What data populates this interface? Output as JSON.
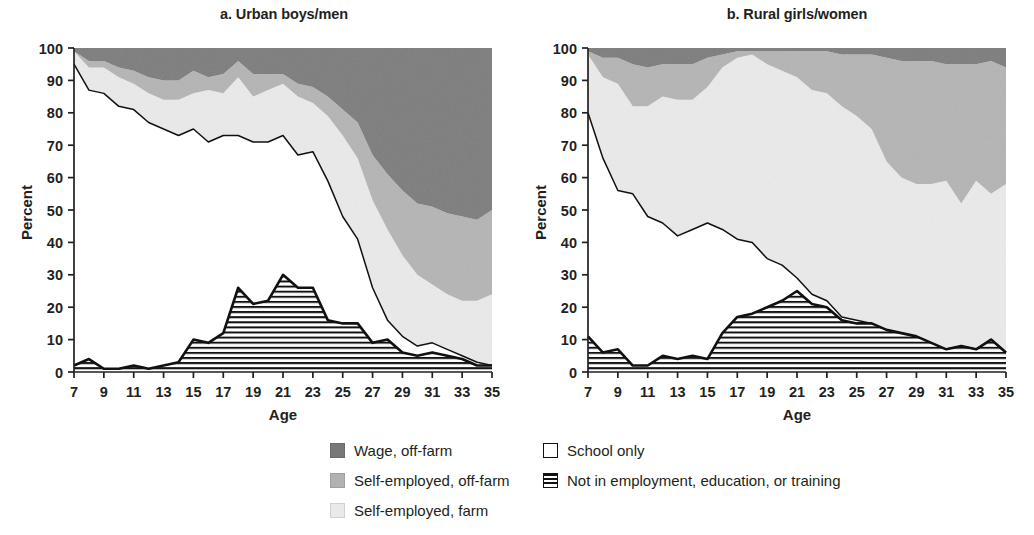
{
  "figure": {
    "panels": [
      {
        "id": "a",
        "title": "a. Urban boys/men",
        "xlabel": "Age",
        "ylabel": "Percent"
      },
      {
        "id": "b",
        "title": "b. Rural girls/women",
        "xlabel": "Age",
        "ylabel": "Percent"
      }
    ]
  },
  "legend": {
    "column1": [
      {
        "label": "Wage, off-farm",
        "swatch": "solid",
        "color": "#787878",
        "name": "legend-swatch-wage-off-farm"
      },
      {
        "label": "Self-employed, off-farm",
        "swatch": "solid",
        "color": "#b2b2b2",
        "name": "legend-swatch-self-employed-off-farm"
      },
      {
        "label": "Self-employed, farm",
        "swatch": "solid",
        "color": "#e9e9e9",
        "name": "legend-swatch-self-employed-farm"
      }
    ],
    "column2": [
      {
        "label": "School only",
        "swatch": "solid",
        "color": "#ffffff",
        "name": "legend-swatch-school-only"
      },
      {
        "label": "Not in employment, education, or training",
        "swatch": "hatch",
        "color": "#ffffff",
        "name": "legend-swatch-neet"
      }
    ]
  },
  "chart_data": {
    "type": "area",
    "stacked": true,
    "xlabel": "Age",
    "ylabel": "Percent",
    "xlim": [
      7,
      35
    ],
    "ylim": [
      0,
      100
    ],
    "yticks": [
      0,
      10,
      20,
      30,
      40,
      50,
      60,
      70,
      80,
      90,
      100
    ],
    "xticks": [
      7,
      9,
      11,
      13,
      15,
      17,
      19,
      21,
      23,
      25,
      27,
      29,
      31,
      33,
      35
    ],
    "grid": false,
    "legend_position": "bottom-center",
    "colors": {
      "wage_off_farm": "#787878",
      "self_employed_off_farm": "#b2b2b2",
      "self_employed_farm": "#e9e9e9",
      "school_only": "#ffffff",
      "neet": "#ffffff-hatched"
    },
    "stack_order_bottom_to_top": [
      "Not in employment, education, or training",
      "School only",
      "Self-employed, farm",
      "Self-employed, off-farm",
      "Wage, off-farm"
    ],
    "panels": [
      {
        "id": "a",
        "title": "a. Urban boys/men",
        "x": [
          7,
          8,
          9,
          10,
          11,
          12,
          13,
          14,
          15,
          16,
          17,
          18,
          19,
          20,
          21,
          22,
          23,
          24,
          25,
          26,
          27,
          28,
          29,
          30,
          31,
          32,
          33,
          34,
          35
        ],
        "series": [
          {
            "name": "Not in employment, education, or training",
            "values": [
              2,
              4,
              1,
              1,
              2,
              1,
              2,
              3,
              10,
              9,
              12,
              26,
              21,
              22,
              30,
              26,
              26,
              16,
              15,
              15,
              9,
              10,
              6,
              5,
              6,
              5,
              4,
              2,
              2
            ]
          },
          {
            "name": "School only",
            "values": [
              93,
              83,
              85,
              81,
              79,
              76,
              73,
              70,
              65,
              62,
              61,
              47,
              50,
              49,
              43,
              41,
              42,
              43,
              33,
              26,
              17,
              6,
              5,
              3,
              3,
              2,
              1,
              1,
              0
            ]
          },
          {
            "name": "Self-employed, farm",
            "values": [
              4,
              7,
              8,
              9,
              8,
              9,
              9,
              11,
              11,
              16,
              13,
              18,
              14,
              16,
              16,
              18,
              15,
              20,
              25,
              25,
              27,
              28,
              25,
              22,
              18,
              17,
              17,
              19,
              22
            ]
          },
          {
            "name": "Self-employed, off-farm",
            "values": [
              0,
              2,
              2,
              3,
              4,
              5,
              6,
              6,
              7,
              4,
              6,
              5,
              7,
              5,
              3,
              4,
              5,
              6,
              8,
              11,
              14,
              17,
              20,
              22,
              24,
              25,
              26,
              25,
              26
            ]
          },
          {
            "name": "Wage, off-farm",
            "values": [
              1,
              4,
              4,
              6,
              7,
              9,
              10,
              10,
              7,
              9,
              8,
              4,
              8,
              8,
              8,
              11,
              12,
              15,
              19,
              23,
              33,
              39,
              44,
              48,
              49,
              51,
              52,
              53,
              50
            ]
          }
        ]
      },
      {
        "id": "b",
        "title": "b. Rural girls/women",
        "x": [
          7,
          8,
          9,
          10,
          11,
          12,
          13,
          14,
          15,
          16,
          17,
          18,
          19,
          20,
          21,
          22,
          23,
          24,
          25,
          26,
          27,
          28,
          29,
          30,
          31,
          32,
          33,
          34,
          35
        ],
        "series": [
          {
            "name": "Not in employment, education, or training",
            "values": [
              11,
              6,
              7,
              2,
              2,
              5,
              4,
              5,
              4,
              12,
              17,
              18,
              20,
              22,
              25,
              21,
              20,
              16,
              15,
              15,
              13,
              12,
              11,
              9,
              7,
              8,
              7,
              10,
              6
            ]
          },
          {
            "name": "School only",
            "values": [
              69,
              60,
              49,
              53,
              46,
              41,
              38,
              39,
              42,
              32,
              24,
              22,
              15,
              11,
              4,
              3,
              2,
              1,
              1,
              0,
              0,
              0,
              0,
              0,
              0,
              0,
              0,
              0,
              0
            ]
          },
          {
            "name": "Self-employed, farm",
            "values": [
              18,
              25,
              33,
              27,
              34,
              39,
              42,
              40,
              42,
              50,
              56,
              58,
              60,
              60,
              62,
              63,
              64,
              65,
              63,
              60,
              52,
              48,
              47,
              49,
              52,
              44,
              52,
              45,
              52
            ]
          },
          {
            "name": "Self-employed, off-farm",
            "values": [
              1,
              6,
              8,
              13,
              12,
              10,
              11,
              11,
              9,
              4,
              2,
              1,
              4,
              6,
              8,
              12,
              13,
              16,
              19,
              23,
              32,
              36,
              38,
              38,
              36,
              43,
              36,
              41,
              36
            ]
          },
          {
            "name": "Wage, off-farm",
            "values": [
              1,
              3,
              3,
              5,
              6,
              5,
              5,
              5,
              3,
              2,
              1,
              1,
              1,
              1,
              1,
              1,
              1,
              2,
              2,
              2,
              3,
              4,
              4,
              4,
              5,
              5,
              5,
              4,
              6
            ]
          }
        ]
      }
    ]
  }
}
